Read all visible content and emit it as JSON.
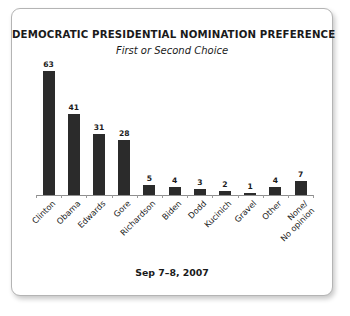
{
  "card": {
    "footer_note": "Sep 7–8, 2007"
  },
  "chart_data": {
    "type": "bar",
    "title": "DEMOCRATIC PRESIDENTIAL NOMINATION PREFERENCE",
    "subtitle": "First or Second Choice",
    "xlabel": "",
    "ylabel": "",
    "ylim": [
      0,
      63
    ],
    "grid": false,
    "legend": null,
    "bar_color": "#2b2b2b",
    "annotation": "Sep 7–8, 2007",
    "categories": [
      "Clinton",
      "Obama",
      "Edwards",
      "Gore",
      "Richardson",
      "Biden",
      "Dodd",
      "Kucinich",
      "Gravel",
      "Other",
      "None/\nNo opinion"
    ],
    "values": [
      63,
      41,
      31,
      28,
      5,
      4,
      3,
      2,
      1,
      4,
      7
    ],
    "data_labels": [
      "63",
      "41",
      "31",
      "28",
      "5",
      "4",
      "3",
      "2",
      "1",
      "4",
      "7"
    ]
  }
}
